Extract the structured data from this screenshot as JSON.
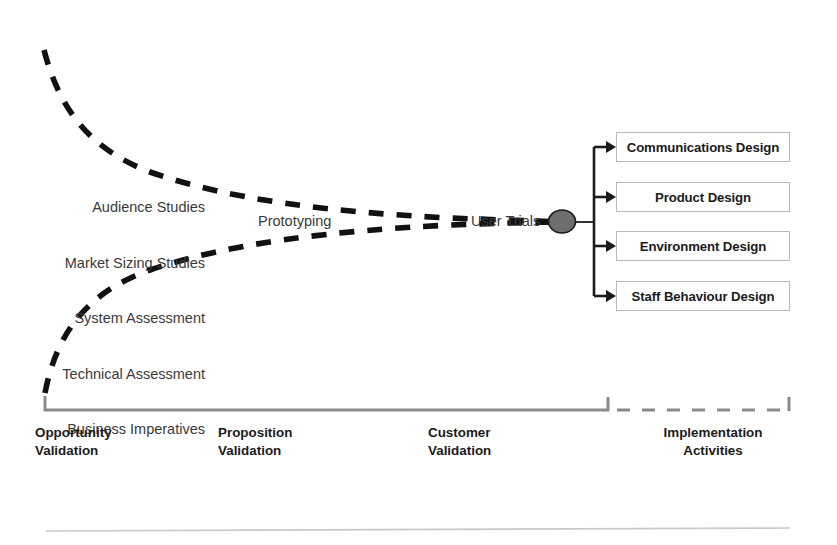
{
  "diagram": {
    "colors": {
      "curve": "#111111",
      "box_border": "#b9b9b9",
      "node_fill": "#6e6e6e",
      "node_stroke": "#1b1b1b",
      "connector": "#1b1b1b",
      "axis": "#8a8a8a",
      "text": "#1b1b1b",
      "background": "#ffffff"
    },
    "inputs": {
      "name": "input-activities-list",
      "items": [
        "Audience Studies",
        "Market Sizing Studies",
        "System Assessment",
        "Technical Assessment",
        "Business Imperatives"
      ]
    },
    "stage_labels": {
      "prototyping": "Prototyping",
      "user_trials": "User Trials"
    },
    "node": {
      "name": "convergence-node",
      "shape": "ellipse"
    },
    "outputs": {
      "name": "design-output-boxes",
      "items": [
        "Communications Design",
        "Product Design",
        "Environment Design",
        "Staff Behaviour Design"
      ]
    },
    "phases": [
      {
        "line1": "Opportunity",
        "line2": "Validation",
        "bracket": "solid"
      },
      {
        "line1": "Proposition",
        "line2": "Validation",
        "bracket": "solid"
      },
      {
        "line1": "Customer",
        "line2": "Validation",
        "bracket": "solid"
      },
      {
        "line1": "Implementation",
        "line2": "Activities",
        "bracket": "dashed"
      }
    ]
  }
}
